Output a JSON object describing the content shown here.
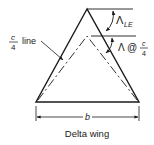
{
  "diagram": {
    "caption": "Delta wing",
    "span_label": "b",
    "quarter_chord_label": {
      "num": "c",
      "den": "4",
      "suffix": "line"
    },
    "leading_edge_sweep": {
      "symbol": "Λ",
      "subscript": "LE"
    },
    "quarter_chord_sweep": {
      "symbol": "Λ @",
      "num": "c",
      "den": "4"
    },
    "colors": {
      "line": "#1a1a1a",
      "background": "#ffffff"
    }
  }
}
